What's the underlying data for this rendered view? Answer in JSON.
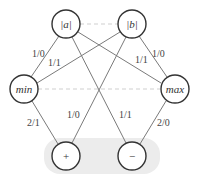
{
  "diagram": {
    "nodes": {
      "abs_a": {
        "label": "|a|"
      },
      "abs_b": {
        "label": "|b|"
      },
      "min": {
        "label": "min"
      },
      "max": {
        "label": "max"
      },
      "plus": {
        "label": "+"
      },
      "minus": {
        "label": "−"
      }
    },
    "edges": {
      "a_min": {
        "label": "1/0"
      },
      "b_min": {
        "label": "1/1"
      },
      "a_max": {
        "label": "1/1"
      },
      "b_max": {
        "label": "1/0"
      },
      "min_plus": {
        "label": "2/1"
      },
      "b_plus": {
        "label": "1/0"
      },
      "a_minus": {
        "label": "1/1"
      },
      "max_minus": {
        "label": "2/0"
      }
    },
    "dashed_links": [
      "|a| — |b|",
      "min — max"
    ],
    "colors": {
      "node_stroke": "#333333",
      "edge": "#777777",
      "dashed": "#cccccc",
      "band": "#ececec"
    }
  }
}
